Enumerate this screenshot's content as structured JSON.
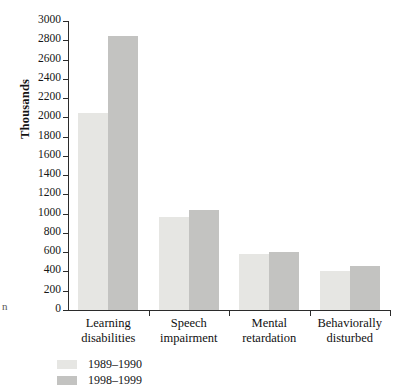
{
  "bleed": {
    "fragment": "n"
  },
  "chart_data": {
    "type": "bar",
    "title": "",
    "xlabel": "",
    "ylabel": "Thousands",
    "ylim": [
      0,
      3000
    ],
    "ytick_step": 200,
    "yticks": [
      3000,
      2800,
      2600,
      2400,
      2200,
      2000,
      1800,
      1600,
      1400,
      1200,
      1000,
      800,
      600,
      400,
      200,
      0
    ],
    "grid": false,
    "legend_position": "below-left",
    "categories": [
      "Learning disabilities",
      "Speech impairment",
      "Mental retardation",
      "Behaviorally disturbed"
    ],
    "category_lines": [
      [
        "Learning",
        "disabilities"
      ],
      [
        "Speech",
        "impairment"
      ],
      [
        "Mental",
        "retardation"
      ],
      [
        "Behaviorally",
        "disturbed"
      ]
    ],
    "series": [
      {
        "name": "1989–1990",
        "color": "#e6e6e3",
        "values": [
          2050,
          965,
          585,
          400
        ]
      },
      {
        "name": "1998–1999",
        "color": "#c3c3c1",
        "values": [
          2840,
          1040,
          605,
          455
        ]
      }
    ]
  }
}
